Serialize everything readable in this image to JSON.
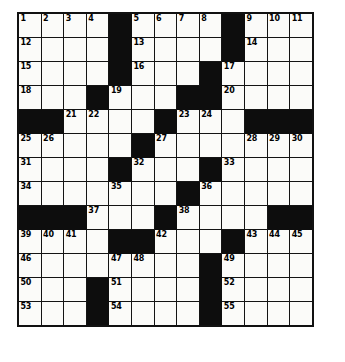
{
  "puzzle": {
    "kind": "crossword-grid",
    "rows": 13,
    "cols": 13,
    "cell_colors": {
      "white": "#fbfbf9",
      "block": "#0d0d0d",
      "grid_line": "#141414",
      "number_text": "#000000",
      "page_background": "#ffffff"
    },
    "grid": [
      [
        0,
        0,
        0,
        0,
        1,
        0,
        0,
        0,
        0,
        1,
        0,
        0,
        0
      ],
      [
        0,
        0,
        0,
        0,
        1,
        0,
        0,
        0,
        0,
        1,
        0,
        0,
        0
      ],
      [
        0,
        0,
        0,
        0,
        1,
        0,
        0,
        0,
        1,
        0,
        0,
        0,
        0
      ],
      [
        0,
        0,
        0,
        1,
        0,
        0,
        0,
        1,
        1,
        0,
        0,
        0,
        0
      ],
      [
        1,
        1,
        0,
        0,
        0,
        0,
        1,
        0,
        0,
        0,
        1,
        1,
        1
      ],
      [
        0,
        0,
        0,
        0,
        0,
        1,
        0,
        0,
        0,
        0,
        0,
        0,
        0
      ],
      [
        0,
        0,
        0,
        0,
        1,
        0,
        0,
        0,
        1,
        0,
        0,
        0,
        0
      ],
      [
        0,
        0,
        0,
        0,
        0,
        0,
        0,
        1,
        0,
        0,
        0,
        0,
        0
      ],
      [
        1,
        1,
        1,
        0,
        0,
        0,
        1,
        0,
        0,
        0,
        0,
        1,
        1
      ],
      [
        0,
        0,
        0,
        0,
        1,
        1,
        0,
        0,
        0,
        1,
        0,
        0,
        0
      ],
      [
        0,
        0,
        0,
        0,
        0,
        0,
        0,
        0,
        1,
        0,
        0,
        0,
        0
      ],
      [
        0,
        0,
        0,
        1,
        0,
        0,
        0,
        0,
        1,
        0,
        0,
        0,
        0
      ],
      [
        0,
        0,
        0,
        1,
        0,
        0,
        0,
        0,
        1,
        0,
        0,
        0,
        0
      ]
    ],
    "numbers": [
      [
        1,
        2,
        3,
        4,
        null,
        5,
        6,
        7,
        8,
        null,
        9,
        10,
        11
      ],
      [
        12,
        null,
        null,
        null,
        null,
        13,
        null,
        null,
        null,
        null,
        14,
        null,
        null
      ],
      [
        15,
        null,
        null,
        null,
        null,
        16,
        null,
        null,
        null,
        17,
        null,
        null,
        null
      ],
      [
        18,
        null,
        null,
        null,
        19,
        null,
        null,
        null,
        null,
        20,
        null,
        null,
        null
      ],
      [
        null,
        null,
        21,
        22,
        null,
        null,
        null,
        23,
        24,
        null,
        null,
        null,
        null
      ],
      [
        25,
        26,
        null,
        null,
        null,
        null,
        27,
        null,
        null,
        null,
        28,
        29,
        30
      ],
      [
        31,
        null,
        null,
        null,
        null,
        32,
        null,
        null,
        null,
        33,
        null,
        null,
        null
      ],
      [
        34,
        null,
        null,
        null,
        35,
        null,
        null,
        null,
        36,
        null,
        null,
        null,
        null
      ],
      [
        null,
        null,
        null,
        37,
        null,
        null,
        null,
        38,
        null,
        null,
        null,
        null,
        null
      ],
      [
        39,
        40,
        41,
        null,
        null,
        null,
        42,
        null,
        null,
        null,
        43,
        44,
        45
      ],
      [
        46,
        null,
        null,
        null,
        47,
        48,
        null,
        null,
        null,
        49,
        null,
        null,
        null
      ],
      [
        50,
        null,
        null,
        null,
        51,
        null,
        null,
        null,
        null,
        52,
        null,
        null,
        null
      ],
      [
        53,
        null,
        null,
        null,
        54,
        null,
        null,
        null,
        null,
        55,
        null,
        null,
        null
      ]
    ],
    "clue_numbers_present": [
      1,
      2,
      3,
      4,
      5,
      6,
      7,
      8,
      9,
      10,
      11,
      12,
      13,
      14,
      15,
      16,
      17,
      18,
      19,
      20,
      21,
      22,
      23,
      24,
      25,
      26,
      27,
      28,
      29,
      30,
      31,
      32,
      33,
      34,
      35,
      36,
      37,
      38,
      39,
      40,
      41,
      42,
      43,
      44,
      45,
      46,
      47,
      48,
      49,
      50,
      51,
      52,
      53,
      54,
      55
    ]
  }
}
